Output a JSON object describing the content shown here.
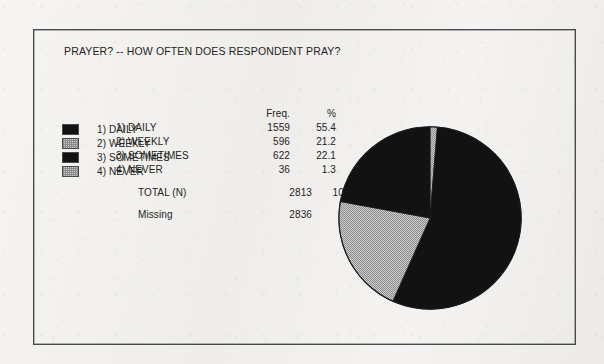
{
  "document": {
    "title": "PRAYER? -- HOW OFTEN DOES RESPONDENT PRAY?"
  },
  "table": {
    "header": {
      "category": "",
      "freq": "Freq.",
      "pct": "%"
    },
    "rows": [
      {
        "label": "1) DAILY",
        "freq": "1559",
        "pct": "55.4",
        "swatch": "solid"
      },
      {
        "label": "2) WEEKLY",
        "freq": "596",
        "pct": "21.2",
        "swatch": "stipple"
      },
      {
        "label": "3) SOMETIMES",
        "freq": "622",
        "pct": "22.1",
        "swatch": "solid"
      },
      {
        "label": "4) NEVER",
        "freq": "36",
        "pct": "1.3",
        "swatch": "stipple"
      }
    ],
    "total": {
      "label": "TOTAL  (N)",
      "freq": "2813",
      "pct": "100.0"
    },
    "missing": {
      "label": "Missing",
      "freq": "2836",
      "pct": ""
    }
  },
  "colors": {
    "ink": "#232323",
    "frame": "#4a4a4a",
    "slice_solid": "#121212",
    "slice_stipple": "#c9c9c9",
    "stipple_dot": "#8a8a8a",
    "background": "#f2f1ef"
  },
  "chart_data": {
    "type": "pie",
    "title": "PRAYER? -- HOW OFTEN DOES RESPONDENT PRAY?",
    "categories": [
      "1) DAILY",
      "2) WEEKLY",
      "3) SOMETIMES",
      "4) NEVER"
    ],
    "values": [
      1559,
      596,
      622,
      36
    ],
    "percents": [
      55.4,
      21.2,
      22.1,
      1.3
    ],
    "fills": [
      "solid",
      "stipple",
      "solid",
      "stipple"
    ],
    "total": 2813,
    "total_percent": 100.0,
    "missing": 2836,
    "start_angle_deg": 0,
    "direction": "clockwise",
    "slice_order": [
      "4) NEVER",
      "1) DAILY",
      "2) WEEKLY",
      "3) SOMETIMES"
    ],
    "legend_position": "left",
    "xlabel": "",
    "ylabel": "",
    "grid": false
  }
}
